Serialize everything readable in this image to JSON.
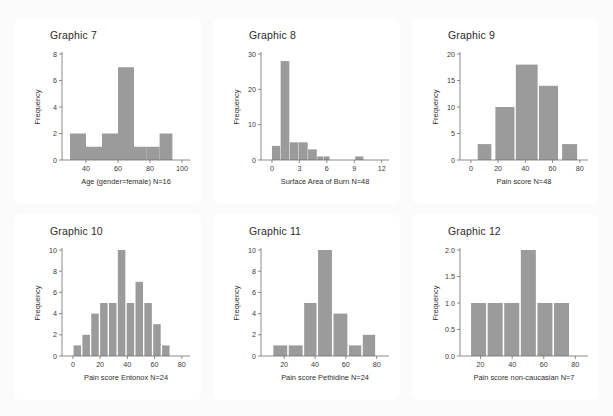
{
  "page": {
    "background_color": "#fbfbfb",
    "card_color": "#ffffff",
    "bar_color": "#9b9b9b",
    "axis_color": "#6e6e6e"
  },
  "charts": [
    {
      "id": "graphic-7",
      "title": "Graphic 7",
      "chart_data": {
        "type": "bar",
        "title": "Graphic 7",
        "xlabel": "Age (gender=female) N=16",
        "ylabel": "Frequency",
        "xlim": [
          25,
          105
        ],
        "ylim": [
          0,
          8
        ],
        "xticks": [
          40,
          60,
          80,
          100
        ],
        "yticks": [
          0,
          2,
          4,
          6,
          8
        ],
        "grid": false,
        "bin_edges": [
          30,
          40,
          50,
          60,
          62,
          70,
          80,
          90
        ],
        "bins": [
          {
            "x0": 30,
            "x1": 40,
            "value": 2
          },
          {
            "x0": 40,
            "x1": 50,
            "value": 1
          },
          {
            "x0": 50,
            "x1": 60,
            "value": 2
          },
          {
            "x0": 60,
            "x1": 70,
            "value": 7
          },
          {
            "x0": 70,
            "x1": 78,
            "value": 1
          },
          {
            "x0": 78,
            "x1": 86,
            "value": 1
          },
          {
            "x0": 86,
            "x1": 94,
            "value": 2
          }
        ],
        "categories": [
          "30-40",
          "40-50",
          "50-60",
          "60-70",
          "70-78",
          "78-86",
          "86-94"
        ],
        "values": [
          2,
          1,
          2,
          7,
          1,
          1,
          2
        ]
      }
    },
    {
      "id": "graphic-8",
      "title": "Graphic 8",
      "chart_data": {
        "type": "bar",
        "title": "Graphic 8",
        "xlabel": "Surface Area of Burn N=48",
        "ylabel": "Frequency",
        "xlim": [
          -1.2,
          12.8
        ],
        "ylim": [
          0,
          30
        ],
        "xticks": [
          0,
          3,
          6,
          9,
          12
        ],
        "yticks": [
          0,
          10,
          20,
          30
        ],
        "grid": false,
        "bin_edges": [
          0,
          1,
          2,
          3,
          4,
          5,
          6,
          9,
          10
        ],
        "bins": [
          {
            "x0": 0,
            "x1": 0.9,
            "value": 4
          },
          {
            "x0": 0.95,
            "x1": 1.9,
            "value": 28
          },
          {
            "x0": 1.95,
            "x1": 2.9,
            "value": 5
          },
          {
            "x0": 2.95,
            "x1": 3.9,
            "value": 5
          },
          {
            "x0": 3.95,
            "x1": 4.9,
            "value": 3
          },
          {
            "x0": 4.95,
            "x1": 5.6,
            "value": 1
          },
          {
            "x0": 5.65,
            "x1": 6.3,
            "value": 1
          },
          {
            "x0": 9.1,
            "x1": 10.0,
            "value": 1
          }
        ],
        "categories": [
          "0-1",
          "1-2",
          "2-3",
          "3-4",
          "4-5",
          "5-5.6",
          "5.6-6.3",
          "9-10"
        ],
        "values": [
          4,
          28,
          5,
          5,
          3,
          1,
          1,
          1
        ]
      }
    },
    {
      "id": "graphic-9",
      "title": "Graphic 9",
      "chart_data": {
        "type": "bar",
        "title": "Graphic 9",
        "xlabel": "Pain score N=48",
        "ylabel": "Frequency",
        "xlim": [
          -8,
          86
        ],
        "ylim": [
          0,
          20
        ],
        "xticks": [
          0,
          20,
          40,
          60,
          80
        ],
        "yticks": [
          0,
          5,
          10,
          15,
          20
        ],
        "grid": false,
        "bin_edges": [
          5,
          15,
          18,
          32,
          33,
          50,
          65,
          68,
          78
        ],
        "bins": [
          {
            "x0": 5,
            "x1": 15,
            "value": 3
          },
          {
            "x0": 18,
            "x1": 32,
            "value": 10
          },
          {
            "x0": 33,
            "x1": 49,
            "value": 18
          },
          {
            "x0": 50,
            "x1": 64,
            "value": 14
          },
          {
            "x0": 67,
            "x1": 78,
            "value": 3
          }
        ],
        "categories": [
          "5-15",
          "18-32",
          "33-49",
          "50-64",
          "67-78"
        ],
        "values": [
          3,
          10,
          18,
          14,
          3
        ]
      }
    },
    {
      "id": "graphic-10",
      "title": "Graphic 10",
      "chart_data": {
        "type": "bar",
        "title": "Graphic 10",
        "xlabel": "Pain score Entonox N=24",
        "ylabel": "Frequency",
        "xlim": [
          -8,
          86
        ],
        "ylim": [
          0,
          10
        ],
        "xticks": [
          0,
          20,
          40,
          60,
          80
        ],
        "yticks": [
          0,
          2,
          4,
          6,
          8,
          10
        ],
        "grid": false,
        "bin_edges": [
          0,
          6.5,
          13,
          19.5,
          26,
          32.5,
          39,
          45.5,
          52,
          58.5,
          65,
          71.5
        ],
        "bins": [
          {
            "x0": 0.5,
            "x1": 6.0,
            "value": 1
          },
          {
            "x0": 7.0,
            "x1": 12.5,
            "value": 2
          },
          {
            "x0": 13.5,
            "x1": 19.0,
            "value": 4
          },
          {
            "x0": 20.0,
            "x1": 25.5,
            "value": 5
          },
          {
            "x0": 26.5,
            "x1": 32.0,
            "value": 5
          },
          {
            "x0": 33.0,
            "x1": 38.5,
            "value": 10
          },
          {
            "x0": 39.5,
            "x1": 45.0,
            "value": 5
          },
          {
            "x0": 46.0,
            "x1": 51.5,
            "value": 7
          },
          {
            "x0": 52.5,
            "x1": 58.0,
            "value": 5
          },
          {
            "x0": 59.0,
            "x1": 64.5,
            "value": 3
          },
          {
            "x0": 65.5,
            "x1": 71.0,
            "value": 1
          }
        ],
        "categories": [
          "0-6",
          "7-13",
          "14-19",
          "20-26",
          "27-32",
          "33-39",
          "40-45",
          "46-52",
          "53-58",
          "59-65",
          "66-71"
        ],
        "values": [
          1,
          2,
          4,
          5,
          5,
          10,
          5,
          7,
          5,
          3,
          1
        ]
      }
    },
    {
      "id": "graphic-11",
      "title": "Graphic 11",
      "chart_data": {
        "type": "bar",
        "title": "Graphic 11",
        "xlabel": "Pain score Pethidine N=24",
        "ylabel": "Frequency",
        "xlim": [
          5,
          88
        ],
        "ylim": [
          0,
          10
        ],
        "xticks": [
          20,
          40,
          60,
          80
        ],
        "yticks": [
          0,
          2,
          4,
          6,
          8,
          10
        ],
        "grid": false,
        "bin_edges": [
          13,
          22,
          23,
          32,
          33,
          42,
          43,
          52,
          53,
          62,
          63,
          72,
          73,
          79
        ],
        "bins": [
          {
            "x0": 13,
            "x1": 22,
            "value": 1
          },
          {
            "x0": 23,
            "x1": 32,
            "value": 1
          },
          {
            "x0": 33,
            "x1": 41,
            "value": 5
          },
          {
            "x0": 42,
            "x1": 51,
            "value": 10
          },
          {
            "x0": 52,
            "x1": 61,
            "value": 4
          },
          {
            "x0": 62,
            "x1": 70,
            "value": 1
          },
          {
            "x0": 71,
            "x1": 79,
            "value": 2
          }
        ],
        "categories": [
          "13-22",
          "23-32",
          "33-41",
          "42-51",
          "52-61",
          "62-70",
          "71-79"
        ],
        "values": [
          1,
          1,
          5,
          10,
          4,
          1,
          2
        ]
      }
    },
    {
      "id": "graphic-12",
      "title": "Graphic 12",
      "chart_data": {
        "type": "bar",
        "title": "Graphic 12",
        "xlabel": "Pain score non-caucasian N=7",
        "ylabel": "Frequency",
        "xlim": [
          7,
          88
        ],
        "ylim": [
          0,
          2.0
        ],
        "xticks": [
          20,
          40,
          60,
          80
        ],
        "yticks": [
          "0.0",
          "0.5",
          "1.0",
          "1.5",
          "2.0"
        ],
        "ytick_values": [
          0,
          0.5,
          1.0,
          1.5,
          2.0
        ],
        "grid": false,
        "bin_edges": [
          14,
          24,
          25,
          35,
          36,
          46,
          47,
          57,
          58,
          68,
          69,
          79
        ],
        "bins": [
          {
            "x0": 14,
            "x1": 23.5,
            "value": 1
          },
          {
            "x0": 24.5,
            "x1": 34,
            "value": 1
          },
          {
            "x0": 35,
            "x1": 44.5,
            "value": 1
          },
          {
            "x0": 45.5,
            "x1": 55,
            "value": 2
          },
          {
            "x0": 56,
            "x1": 65.5,
            "value": 1
          },
          {
            "x0": 66.5,
            "x1": 76,
            "value": 1
          }
        ],
        "categories": [
          "14-23",
          "25-34",
          "35-44",
          "46-55",
          "56-65",
          "67-76"
        ],
        "values": [
          1,
          1,
          1,
          2,
          1,
          1
        ]
      }
    }
  ]
}
